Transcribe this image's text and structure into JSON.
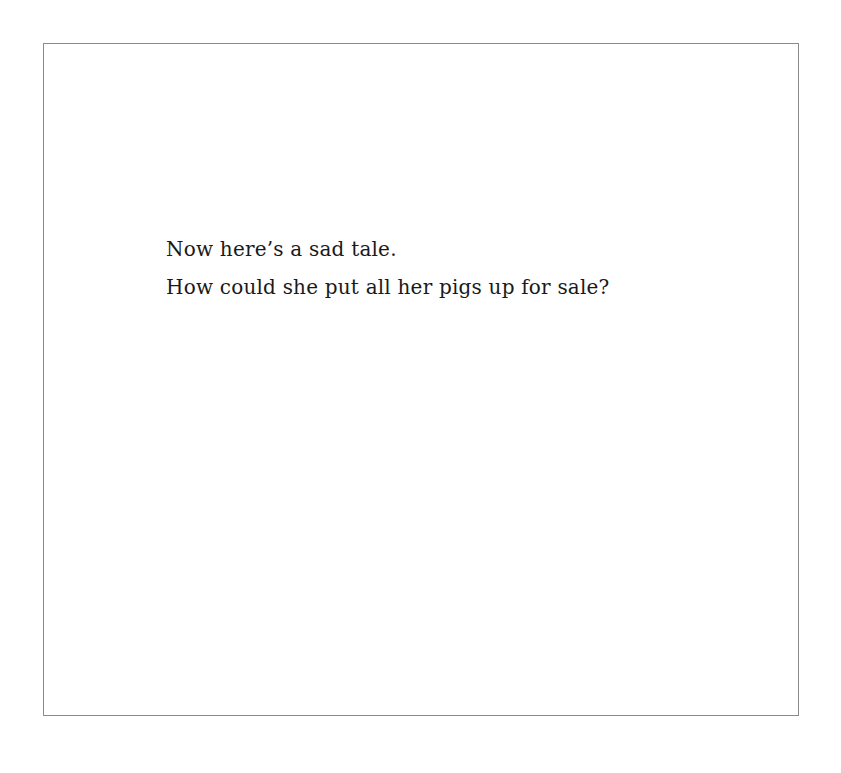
{
  "page": {
    "lines": [
      "Now here’s a sad tale.",
      "How could she put all her pigs up for sale?"
    ]
  }
}
